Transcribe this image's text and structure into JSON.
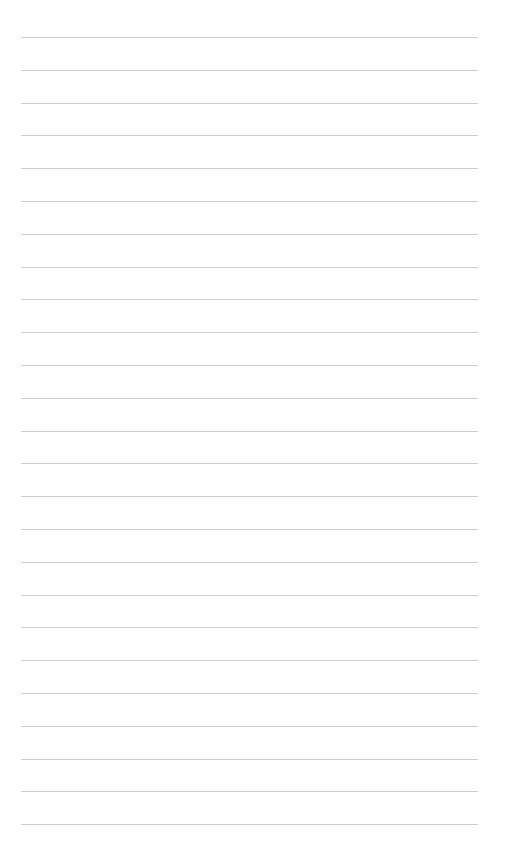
{
  "page": {
    "type": "lined-paper",
    "background_color": "#fefefe",
    "line_color": "#c9c9c9",
    "line_count": 25,
    "first_line_y": 37,
    "line_spacing": 32.8,
    "line_left_x": 21,
    "line_right_x": 478,
    "text_content": []
  }
}
